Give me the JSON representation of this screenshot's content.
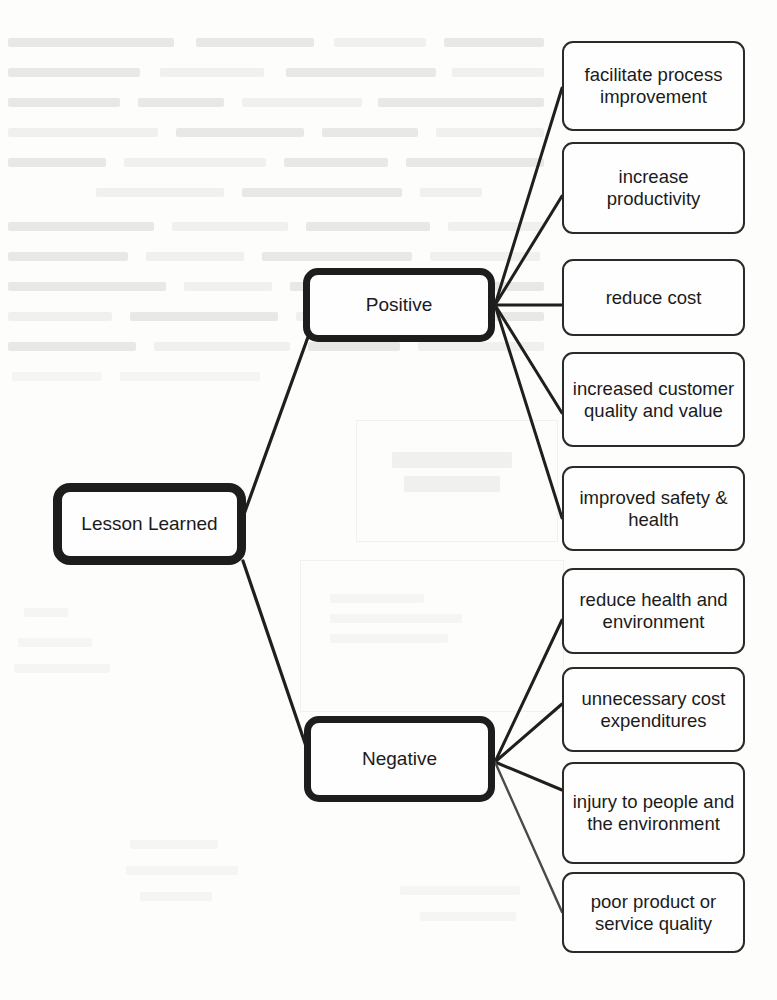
{
  "diagram": {
    "type": "mind-map",
    "title": "Lesson Learned",
    "root": {
      "id": "lesson-learned",
      "label": "Lesson Learned"
    },
    "branches": [
      {
        "id": "positive",
        "label": "Positive",
        "children": [
          {
            "id": "facilitate-process-improvement",
            "label": "facilitate process improvement"
          },
          {
            "id": "increase-productivity",
            "label": "increase productivity"
          },
          {
            "id": "reduce-cost",
            "label": "reduce cost"
          },
          {
            "id": "increased-customer-quality-and-value",
            "label": "increased customer quality and value"
          },
          {
            "id": "improved-safety-and-health",
            "label": "improved safety & health"
          }
        ]
      },
      {
        "id": "negative",
        "label": "Negative",
        "children": [
          {
            "id": "reduce-health-and-environment",
            "label": "reduce health and environment"
          },
          {
            "id": "unnecessary-cost-expenditures",
            "label": "unnecessary cost expenditures"
          },
          {
            "id": "injury-to-people-and-the-environment",
            "label": "injury to people and the environment"
          },
          {
            "id": "poor-product-or-service-quality",
            "label": "poor product or service quality"
          }
        ]
      }
    ],
    "colors": {
      "node_border": "#1d1d1d",
      "leaf_border": "#2a2a2a",
      "node_fill": "#fefefe",
      "edge": "#1f1f1f",
      "text": "#1b1b1b",
      "background": "#fdfdfc"
    }
  }
}
